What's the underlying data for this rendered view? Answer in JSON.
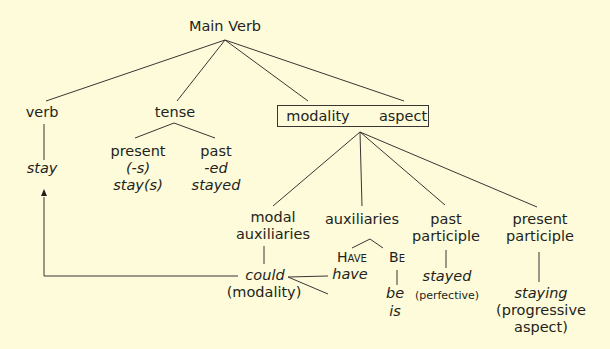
{
  "diagram": {
    "root": "Main Verb",
    "verb": {
      "label": "verb",
      "example": "stay"
    },
    "tense": {
      "label": "tense",
      "present": {
        "label": "present",
        "marker": "(-s)",
        "example": "stay(s)"
      },
      "past": {
        "label": "past",
        "marker": "-ed",
        "example": "stayed"
      }
    },
    "box": {
      "modality": "modality",
      "aspect": "aspect"
    },
    "modal_auxiliaries": {
      "line1": "modal",
      "line2": "auxiliaries",
      "example": "could",
      "note": "(modality)"
    },
    "auxiliaries": {
      "label": "auxiliaries",
      "have": {
        "cap": "H",
        "rest": "AVE",
        "example": "have"
      },
      "be": {
        "cap": "B",
        "rest": "E",
        "examples": [
          "be",
          "is"
        ]
      }
    },
    "past_participle": {
      "line1": "past",
      "line2": "participle",
      "example": "stayed",
      "note": "(perfective)"
    },
    "present_participle": {
      "line1": "present",
      "line2": "participle",
      "example": "staying",
      "note1": "(progressive",
      "note2": "aspect)"
    }
  },
  "colors": {
    "background": "#fdfbd9",
    "ink": "#231f20"
  }
}
